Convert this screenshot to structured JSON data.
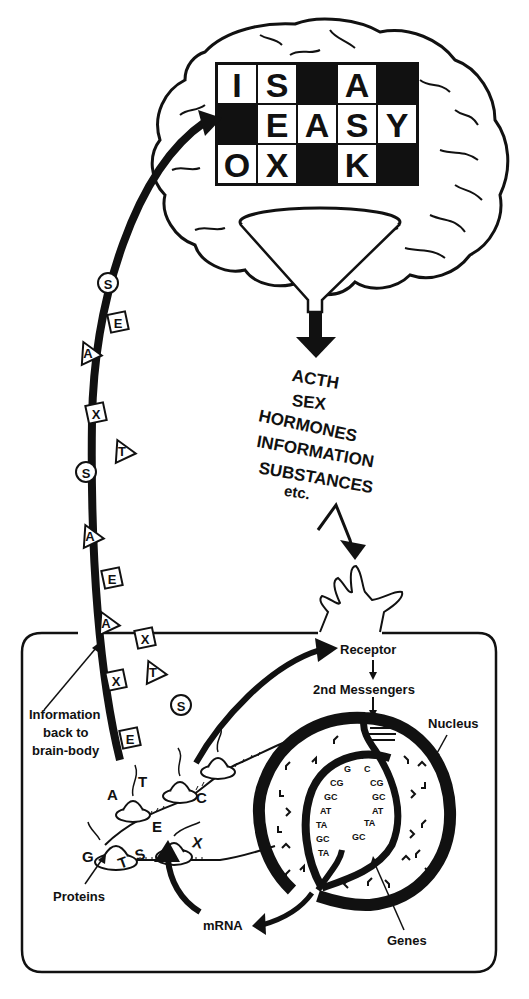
{
  "brain": {
    "crossword": {
      "rows": [
        [
          "I",
          "S",
          "",
          "A",
          ""
        ],
        [
          "",
          "E",
          "A",
          "S",
          "Y"
        ],
        [
          "O",
          "X",
          "",
          "K",
          ""
        ]
      ],
      "black_cells": [
        [
          0,
          2
        ],
        [
          0,
          4
        ],
        [
          1,
          0
        ],
        [
          2,
          2
        ],
        [
          2,
          4
        ]
      ]
    }
  },
  "funnel_outputs": {
    "lines": [
      "ACTH",
      "SEX",
      "HORMONES",
      "INFORMATION",
      "SUBSTANCES",
      "etc."
    ]
  },
  "pathway_tokens": [
    {
      "shape": "circle",
      "letter": "S"
    },
    {
      "shape": "square",
      "letter": "E"
    },
    {
      "shape": "triangle",
      "letter": "A"
    },
    {
      "shape": "square",
      "letter": "X"
    },
    {
      "shape": "triangle",
      "letter": "T"
    },
    {
      "shape": "circle",
      "letter": "S"
    },
    {
      "shape": "triangle",
      "letter": "A"
    },
    {
      "shape": "square",
      "letter": "E"
    },
    {
      "shape": "triangle",
      "letter": "A"
    },
    {
      "shape": "square",
      "letter": "X"
    },
    {
      "shape": "triangle",
      "letter": "T"
    },
    {
      "shape": "square",
      "letter": "X"
    },
    {
      "shape": "circle",
      "letter": "S"
    },
    {
      "shape": "square",
      "letter": "E"
    }
  ],
  "cell": {
    "labels": {
      "receptor": "Receptor",
      "second_messengers": "2nd Messengers",
      "nucleus": "Nucleus",
      "genes": "Genes",
      "mrna": "mRNA",
      "proteins": "Proteins",
      "info_back_line1": "Information",
      "info_back_line2": "back to",
      "info_back_line3": "brain-body"
    },
    "protein_letters": [
      "T",
      "A",
      "C",
      "G",
      "E",
      "S",
      "T",
      "X"
    ],
    "base_pairs_left": [
      "AT",
      "G",
      "CG",
      "GC",
      "AT",
      "TA",
      "GC",
      "TA"
    ],
    "base_pairs_right": [
      "C",
      "CG",
      "GC",
      "AT",
      "TA",
      "GC"
    ]
  }
}
